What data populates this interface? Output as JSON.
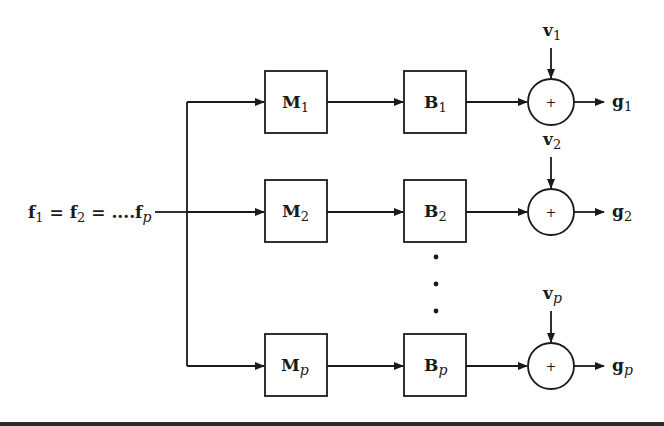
{
  "diagram": {
    "input_label": {
      "f1": "f",
      "s1": "1",
      "eq1": " = ",
      "f2": "f",
      "s2": "2",
      "eq2": " = ....",
      "fp": "f",
      "sp": "p"
    },
    "rows": [
      {
        "m": "M",
        "m_sub": "1",
        "b": "B",
        "b_sub": "1",
        "v": "v",
        "v_sub": "1",
        "g": "g",
        "g_sub": "1",
        "sum_symbol": "+"
      },
      {
        "m": "M",
        "m_sub": "2",
        "b": "B",
        "b_sub": "2",
        "v": "v",
        "v_sub": "2",
        "g": "g",
        "g_sub": "2",
        "sum_symbol": "+"
      },
      {
        "m": "M",
        "m_sub": "p",
        "b": "B",
        "b_sub": "p",
        "v": "v",
        "v_sub": "p",
        "g": "g",
        "g_sub": "p",
        "sum_symbol": "+"
      }
    ],
    "ellipsis": "⋮",
    "colors": {
      "stroke": "#1a1a1a",
      "background": "#ffffff"
    }
  }
}
